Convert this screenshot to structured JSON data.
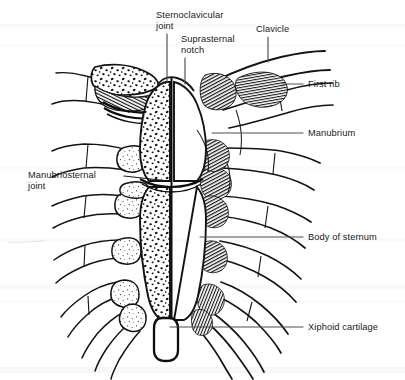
{
  "figure": {
    "kind": "anatomical-line-drawing",
    "background_color": "#ffffff",
    "ink_color": "#1a1a1a",
    "leader_line_color": "#4d4d4d",
    "width": 405,
    "height": 380
  },
  "labels": {
    "sternoclavicular_joint": "Sternoclavicular\njoint",
    "suprasternal_notch": "Suprasternal\nnotch",
    "clavicle": "Clavicle",
    "first_rib": "First rib",
    "manubrium": "Manubrium",
    "body_of_sternum": "Body of sternum",
    "xiphoid_cartilage": "Xiphoid cartilage",
    "manubriosternal_joint": "Manubriosternal\njoint"
  },
  "anatomy_parts": [
    {
      "name": "Sternoclavicular joint",
      "side": "left",
      "callout_side": "top"
    },
    {
      "name": "Suprasternal notch",
      "side": "midline",
      "callout_side": "top"
    },
    {
      "name": "Clavicle",
      "side": "right",
      "callout_side": "top"
    },
    {
      "name": "First rib",
      "side": "right",
      "callout_side": "right"
    },
    {
      "name": "Manubrium",
      "side": "right",
      "callout_side": "right"
    },
    {
      "name": "Body of sternum",
      "side": "right",
      "callout_side": "right"
    },
    {
      "name": "Xiphoid cartilage",
      "side": "midline",
      "callout_side": "right"
    },
    {
      "name": "Manubriosternal joint",
      "side": "left",
      "callout_side": "left"
    }
  ]
}
